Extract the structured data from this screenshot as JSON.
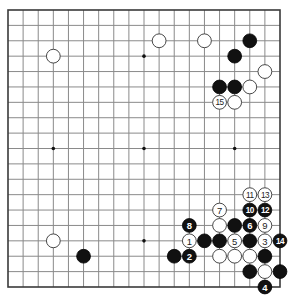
{
  "diagram": {
    "type": "go-board",
    "board_size": 19,
    "colors": {
      "black": "#111111",
      "white": "#ffffff",
      "grid": "#8a8a8a",
      "border": "#3a3a3a"
    },
    "star_points": [
      [
        3,
        3
      ],
      [
        9,
        3
      ],
      [
        15,
        3
      ],
      [
        3,
        9
      ],
      [
        9,
        9
      ],
      [
        15,
        9
      ],
      [
        3,
        15
      ],
      [
        9,
        15
      ],
      [
        15,
        15
      ]
    ],
    "stones": [
      {
        "color": "white",
        "col": 3,
        "row": 3
      },
      {
        "color": "white",
        "col": 10,
        "row": 2
      },
      {
        "color": "white",
        "col": 13,
        "row": 2
      },
      {
        "color": "black",
        "col": 16,
        "row": 2
      },
      {
        "color": "black",
        "col": 15,
        "row": 3
      },
      {
        "color": "white",
        "col": 17,
        "row": 4
      },
      {
        "color": "black",
        "col": 14,
        "row": 5
      },
      {
        "color": "black",
        "col": 15,
        "row": 5
      },
      {
        "color": "white",
        "col": 16,
        "row": 5
      },
      {
        "color": "white",
        "col": 14,
        "row": 6,
        "label": "15"
      },
      {
        "color": "white",
        "col": 15,
        "row": 6
      },
      {
        "color": "white",
        "col": 16,
        "row": 12,
        "label": "11"
      },
      {
        "color": "white",
        "col": 17,
        "row": 12,
        "label": "13"
      },
      {
        "color": "white",
        "col": 14,
        "row": 13,
        "label": "7"
      },
      {
        "color": "black",
        "col": 16,
        "row": 13,
        "label": "10"
      },
      {
        "color": "black",
        "col": 17,
        "row": 13,
        "label": "12"
      },
      {
        "color": "black",
        "col": 12,
        "row": 14,
        "label": "8"
      },
      {
        "color": "white",
        "col": 14,
        "row": 14
      },
      {
        "color": "black",
        "col": 15,
        "row": 14
      },
      {
        "color": "black",
        "col": 16,
        "row": 14,
        "label": "6"
      },
      {
        "color": "white",
        "col": 17,
        "row": 14,
        "label": "9"
      },
      {
        "color": "white",
        "col": 12,
        "row": 15,
        "label": "1"
      },
      {
        "color": "black",
        "col": 13,
        "row": 15
      },
      {
        "color": "black",
        "col": 14,
        "row": 15
      },
      {
        "color": "white",
        "col": 15,
        "row": 15,
        "label": "5"
      },
      {
        "color": "black",
        "col": 16,
        "row": 15
      },
      {
        "color": "white",
        "col": 17,
        "row": 15,
        "label": "3"
      },
      {
        "color": "black",
        "col": 18,
        "row": 15,
        "label": "14"
      },
      {
        "color": "black",
        "col": 11,
        "row": 16
      },
      {
        "color": "black",
        "col": 12,
        "row": 16,
        "label": "2"
      },
      {
        "color": "white",
        "col": 14,
        "row": 16
      },
      {
        "color": "white",
        "col": 15,
        "row": 16
      },
      {
        "color": "white",
        "col": 16,
        "row": 16
      },
      {
        "color": "black",
        "col": 17,
        "row": 16
      },
      {
        "color": "black",
        "col": 16,
        "row": 17
      },
      {
        "color": "white",
        "col": 17,
        "row": 17
      },
      {
        "color": "black",
        "col": 18,
        "row": 17
      },
      {
        "color": "black",
        "col": 17,
        "row": 18,
        "label": "4"
      },
      {
        "color": "white",
        "col": 3,
        "row": 15
      },
      {
        "color": "black",
        "col": 5,
        "row": 16
      }
    ]
  }
}
